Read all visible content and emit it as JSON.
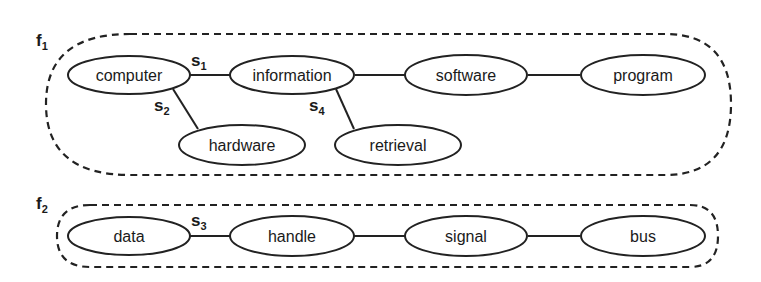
{
  "diagram": {
    "type": "semantic-graph",
    "groups": [
      {
        "id": "f1",
        "label": "f",
        "subscript": "1"
      },
      {
        "id": "f2",
        "label": "f",
        "subscript": "2"
      }
    ],
    "nodes": [
      {
        "id": "computer",
        "label": "computer",
        "group": "f1"
      },
      {
        "id": "information",
        "label": "information",
        "group": "f1"
      },
      {
        "id": "software",
        "label": "software",
        "group": "f1"
      },
      {
        "id": "program",
        "label": "program",
        "group": "f1"
      },
      {
        "id": "hardware",
        "label": "hardware",
        "group": "f1"
      },
      {
        "id": "retrieval",
        "label": "retrieval",
        "group": "f1"
      },
      {
        "id": "data",
        "label": "data",
        "group": "f2"
      },
      {
        "id": "handle",
        "label": "handle",
        "group": "f2"
      },
      {
        "id": "signal",
        "label": "signal",
        "group": "f2"
      },
      {
        "id": "bus",
        "label": "bus",
        "group": "f2"
      }
    ],
    "edges": [
      {
        "from": "computer",
        "to": "information",
        "label": "s",
        "subscript": "1"
      },
      {
        "from": "computer",
        "to": "hardware",
        "label": "s",
        "subscript": "2"
      },
      {
        "from": "information",
        "to": "retrieval",
        "label": "s",
        "subscript": "4"
      },
      {
        "from": "information",
        "to": "software",
        "label": "",
        "subscript": ""
      },
      {
        "from": "software",
        "to": "program",
        "label": "",
        "subscript": ""
      },
      {
        "from": "data",
        "to": "handle",
        "label": "s",
        "subscript": "3"
      },
      {
        "from": "handle",
        "to": "signal",
        "label": "",
        "subscript": ""
      },
      {
        "from": "signal",
        "to": "bus",
        "label": "",
        "subscript": ""
      }
    ],
    "colors": {
      "stroke": "#222222",
      "background": "#ffffff",
      "text": "#1a1a1a"
    }
  }
}
